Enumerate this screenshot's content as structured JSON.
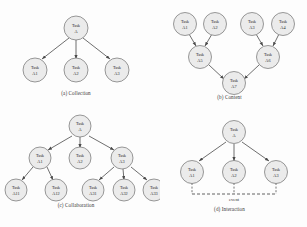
{
  "figure": {
    "background_color": "#fdfdfd",
    "node_fill_color": "#ebebeb",
    "node_stroke_color": "#6e6e6e",
    "edge_color": "#4a4a4a",
    "text_color": "#2a2a2a"
  },
  "panels": [
    {
      "id": "a",
      "caption": "(a) Collection",
      "nodes": [
        {
          "id": "A",
          "line1": "Task",
          "line2": "A",
          "cx": 76,
          "cy": 24
        },
        {
          "id": "A1",
          "line1": "Task",
          "line2": "A1",
          "cx": 35,
          "cy": 66
        },
        {
          "id": "A2",
          "line1": "Task",
          "line2": "A2",
          "cx": 76,
          "cy": 66
        },
        {
          "id": "A3",
          "line1": "Task",
          "line2": "A3",
          "cx": 117,
          "cy": 66
        }
      ],
      "edges": [
        {
          "from": "A",
          "to": "A1"
        },
        {
          "from": "A",
          "to": "A2"
        },
        {
          "from": "A",
          "to": "A3"
        }
      ]
    },
    {
      "id": "b",
      "caption": "(b) Content",
      "nodes": [
        {
          "id": "A1",
          "line1": "Task",
          "line2": "A1",
          "cx": 33,
          "cy": 20
        },
        {
          "id": "A2",
          "line1": "Task",
          "line2": "A2",
          "cx": 63,
          "cy": 20
        },
        {
          "id": "A3",
          "line1": "Task",
          "line2": "A3",
          "cx": 100,
          "cy": 20
        },
        {
          "id": "A4",
          "line1": "Task",
          "line2": "A4",
          "cx": 131,
          "cy": 20
        },
        {
          "id": "A5",
          "line1": "Task",
          "line2": "A5",
          "cx": 48,
          "cy": 53
        },
        {
          "id": "A6",
          "line1": "Task",
          "line2": "A6",
          "cx": 116,
          "cy": 53
        },
        {
          "id": "A7",
          "line1": "Task",
          "line2": "A7",
          "cx": 82,
          "cy": 79
        }
      ],
      "edges": [
        {
          "from": "A1",
          "to": "A5"
        },
        {
          "from": "A2",
          "to": "A5"
        },
        {
          "from": "A3",
          "to": "A6"
        },
        {
          "from": "A4",
          "to": "A6"
        },
        {
          "from": "A5",
          "to": "A7"
        },
        {
          "from": "A6",
          "to": "A7"
        }
      ]
    },
    {
      "id": "c",
      "caption": "(c) Collaboration",
      "nodes": [
        {
          "id": "A",
          "line1": "Task",
          "line2": "A",
          "cx": 80,
          "cy": 16
        },
        {
          "id": "A1",
          "line1": "Task",
          "line2": "A1",
          "cx": 40,
          "cy": 48
        },
        {
          "id": "A2",
          "line1": "Task",
          "line2": "A2",
          "cx": 80,
          "cy": 48
        },
        {
          "id": "A3",
          "line1": "Task",
          "line2": "A3",
          "cx": 122,
          "cy": 48
        },
        {
          "id": "A11",
          "line1": "Task",
          "line2": "A11",
          "cx": 16,
          "cy": 80
        },
        {
          "id": "A12",
          "line1": "Task",
          "line2": "A12",
          "cx": 56,
          "cy": 80
        },
        {
          "id": "A31",
          "line1": "Task",
          "line2": "A31",
          "cx": 93,
          "cy": 80
        },
        {
          "id": "A32",
          "line1": "Task",
          "line2": "A32",
          "cx": 124,
          "cy": 80
        },
        {
          "id": "A33",
          "line1": "Task",
          "line2": "A33",
          "cx": 154,
          "cy": 80
        }
      ],
      "edges": [
        {
          "from": "A",
          "to": "A1"
        },
        {
          "from": "A",
          "to": "A2"
        },
        {
          "from": "A",
          "to": "A3"
        },
        {
          "from": "A1",
          "to": "A11"
        },
        {
          "from": "A1",
          "to": "A12"
        },
        {
          "from": "A3",
          "to": "A31"
        },
        {
          "from": "A3",
          "to": "A32"
        },
        {
          "from": "A3",
          "to": "A33"
        }
      ]
    },
    {
      "id": "d",
      "caption": "(d) Interaction",
      "event_label": "event",
      "nodes": [
        {
          "id": "A",
          "line1": "Task",
          "line2": "A",
          "cx": 82,
          "cy": 22
        },
        {
          "id": "A1",
          "line1": "Task",
          "line2": "A1",
          "cx": 40,
          "cy": 62
        },
        {
          "id": "A2",
          "line1": "Task",
          "line2": "A2",
          "cx": 82,
          "cy": 62
        },
        {
          "id": "A3",
          "line1": "Task",
          "line2": "A3",
          "cx": 124,
          "cy": 62
        }
      ],
      "edges": [
        {
          "from": "A",
          "to": "A1"
        },
        {
          "from": "A",
          "to": "A2"
        },
        {
          "from": "A",
          "to": "A3"
        }
      ],
      "event_line": {
        "x1": 40,
        "x2": 124,
        "y": 84
      }
    }
  ]
}
